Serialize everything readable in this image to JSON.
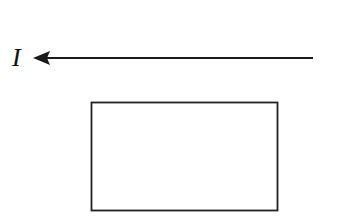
{
  "diagram": {
    "current_label": "I",
    "arrow": {
      "direction": "left",
      "x_start": 313,
      "x_end": 33,
      "y": 58,
      "color": "#1a1a1a"
    },
    "rectangle": {
      "x": 91,
      "y": 102,
      "width": 186,
      "height": 108,
      "stroke": "#222222"
    }
  }
}
